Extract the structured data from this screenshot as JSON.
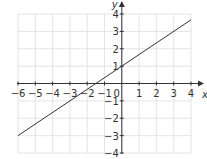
{
  "chart_data": {
    "type": "line",
    "title": "",
    "xlabel": "x",
    "ylabel": "y",
    "xlim": [
      -6,
      4
    ],
    "ylim": [
      -4,
      4
    ],
    "grid": true,
    "xticks": [
      -6,
      -5,
      -4,
      -3,
      -2,
      -1,
      1,
      2,
      3,
      4
    ],
    "yticks": [
      -4,
      -3,
      -2,
      -1,
      1,
      2,
      3,
      4
    ],
    "origin_label": "0",
    "series": [
      {
        "name": "line",
        "equation": "y = 2/3 x + 1",
        "x": [
          -6,
          4
        ],
        "y": [
          -3,
          3.667
        ]
      }
    ],
    "colors": {
      "line": "#333333",
      "grid": "#dddddd",
      "axis": "#333333"
    }
  }
}
